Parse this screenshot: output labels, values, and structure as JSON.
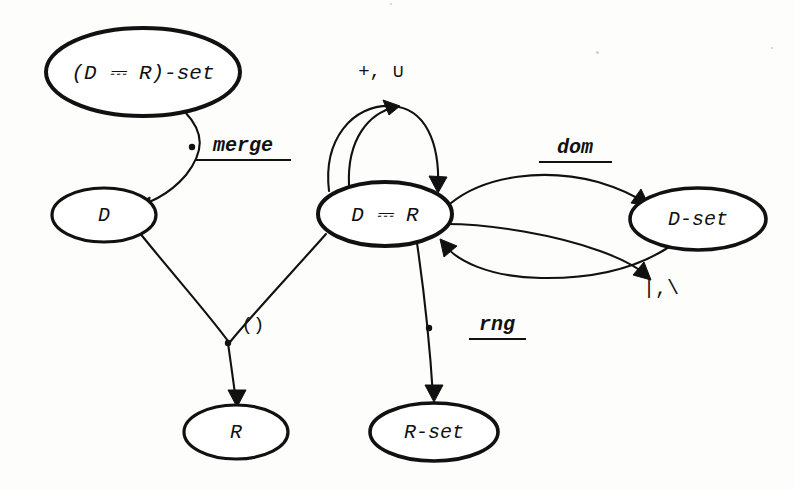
{
  "diagram": {
    "ink_color": "#111111",
    "background_color": "#fdfdfc",
    "map_symbol": "⎓",
    "nodes": [
      {
        "id": "dr-set",
        "label": "(D ⎓ R)-set",
        "cx": 143,
        "cy": 72,
        "rx": 97,
        "ry": 44,
        "stroke_width": 4.0,
        "font_size": 21
      },
      {
        "id": "d",
        "label": "D",
        "cx": 104,
        "cy": 215,
        "rx": 52,
        "ry": 27,
        "stroke_width": 3.2,
        "font_size": 20
      },
      {
        "id": "dr",
        "label": "D ⎓ R",
        "cx": 385,
        "cy": 214,
        "rx": 67,
        "ry": 32,
        "stroke_width": 4.0,
        "font_size": 21
      },
      {
        "id": "d-set",
        "label": "D-set",
        "cx": 698,
        "cy": 219,
        "rx": 68,
        "ry": 31,
        "stroke_width": 3.6,
        "font_size": 20
      },
      {
        "id": "r",
        "label": "R",
        "cx": 236,
        "cy": 432,
        "rx": 52,
        "ry": 27,
        "stroke_width": 3.2,
        "font_size": 20
      },
      {
        "id": "r-set",
        "label": "R-set",
        "cx": 434,
        "cy": 432,
        "rx": 64,
        "ry": 29,
        "stroke_width": 3.6,
        "font_size": 20
      }
    ],
    "edges": [
      {
        "id": "merge",
        "label": "merge",
        "from": "dr-set",
        "to": "d",
        "underlined": true,
        "label_x": 243,
        "label_y": 146,
        "label_font_size": 20,
        "label_style": "italic",
        "underline_x1": 196,
        "underline_x2": 291,
        "underline_y": 160,
        "path": "M 185 112 C 205 133 204 152 186 175 C 168 196 146 205 133 206",
        "dot_x": 192,
        "dot_y": 147,
        "head": "133,206 150,197 149,214"
      },
      {
        "id": "plus-union-inner",
        "label": "+, ∪",
        "from": "dr",
        "to": "dr",
        "underlined": false,
        "label_x": 381,
        "label_y": 72,
        "label_font_size": 19,
        "label_style": "plain",
        "path": "M 349 185 C 347 140 368 113 396 107",
        "head": "400,106 383,100 389,115"
      },
      {
        "id": "plus-union-outer",
        "label": "",
        "from": "dr",
        "to": "dr",
        "underlined": false,
        "path": "M 329 191 C 323 140 352 104 392 106 C 425 108 440 142 438 188",
        "head": "438,193 429,176 447,177"
      },
      {
        "id": "dom",
        "label": "dom",
        "from": "dr",
        "to": "d-set",
        "underlined": true,
        "label_x": 575,
        "label_y": 148,
        "label_font_size": 20,
        "label_style": "italic",
        "underline_x1": 539,
        "underline_x2": 612,
        "underline_y": 162,
        "path": "M 451 203 C 486 175 545 168 598 182 C 618 188 635 196 645 203",
        "head": "649,206 631,203 641,189"
      },
      {
        "id": "restrict",
        "label": "|,\\",
        "from": "d-set",
        "to": "dr",
        "underlined": false,
        "label_x": 661,
        "label_y": 289,
        "label_font_size": 20,
        "label_style": "plain",
        "path": "M 669 247 C 640 266 598 279 541 278 C 489 277 456 261 443 243",
        "head": "440,239 457,246 444,257"
      },
      {
        "id": "restrict-lower",
        "label": "",
        "from": "dr",
        "to": "d-set",
        "underlined": false,
        "path": "M 446 224 C 492 224 556 235 600 251 C 625 260 641 270 648 277",
        "head": "651,280 633,275 644,262"
      },
      {
        "id": "apply-from-d",
        "label": "()",
        "from": "d",
        "to": "r",
        "underlined": false,
        "label_x": 253,
        "label_y": 325,
        "label_font_size": 19,
        "label_style": "plain",
        "path": "M 139 232 C 171 272 206 311 228 341",
        "dot_x": 228,
        "dot_y": 343
      },
      {
        "id": "apply-from-dr",
        "label": "",
        "from": "dr",
        "to": "r",
        "underlined": false,
        "path": "M 326 234 C 295 269 252 315 230 342"
      },
      {
        "id": "apply-to-r",
        "label": "",
        "from": "junction",
        "to": "r",
        "underlined": false,
        "path": "M 228 343 C 231 365 234 385 236 402",
        "head": "237,407 228,390 246,390"
      },
      {
        "id": "rng",
        "label": "rng",
        "from": "dr",
        "to": "r-set",
        "underlined": true,
        "label_x": 497,
        "label_y": 325,
        "label_font_size": 20,
        "label_style": "italic",
        "underline_x1": 469,
        "underline_x2": 526,
        "underline_y": 339,
        "path": "M 417 243 C 424 291 430 348 433 396",
        "dot_x": 429,
        "dot_y": 328,
        "head": "434,402 425,385 443,385"
      }
    ]
  }
}
